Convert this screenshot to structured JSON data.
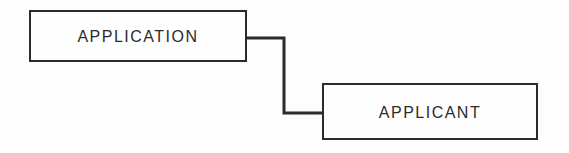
{
  "diagram": {
    "nodes": [
      {
        "id": "application",
        "label": "APPLICATION"
      },
      {
        "id": "applicant",
        "label": "APPLICANT"
      }
    ],
    "connector": {
      "from": "application",
      "to": "applicant",
      "style": "right-angle-elbow"
    },
    "colors": {
      "line": "#2b2b2b",
      "box_fill": "#fefefe",
      "background": "#fdfdfd",
      "text": "#2b2b2b"
    }
  }
}
